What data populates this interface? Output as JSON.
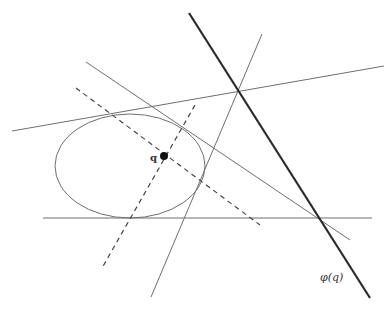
{
  "diagram": {
    "labels": {
      "point": "q",
      "polar_line": "φ(q)"
    },
    "colors": {
      "background": "#ffffff",
      "thin_line": "#6e6e6e",
      "thick_line": "#2a2a2a",
      "dashed_line": "#444444",
      "point": "#111111"
    },
    "elements": {
      "ellipse": {
        "cx": 130,
        "cy": 166,
        "rx": 75,
        "ry": 52
      },
      "point_q": {
        "cx": 164,
        "cy": 156,
        "r": 4
      },
      "polar_line": {
        "x1": 189,
        "y1": 13,
        "x2": 370,
        "y2": 298
      },
      "tangent_upper": {
        "x1": 12,
        "y1": 131,
        "x2": 384,
        "y2": 66
      },
      "tangent_steep": {
        "x1": 262,
        "y1": 34,
        "x2": 151,
        "y2": 297
      },
      "tangent_diagonal": {
        "x1": 86,
        "y1": 62,
        "x2": 350,
        "y2": 240
      },
      "tangent_horizontal": {
        "x1": 43,
        "y1": 218,
        "x2": 372,
        "y2": 218
      },
      "dashed_1": {
        "x1": 76,
        "y1": 88,
        "x2": 260,
        "y2": 225
      },
      "dashed_2": {
        "x1": 195,
        "y1": 105,
        "x2": 102,
        "y2": 268
      }
    }
  }
}
